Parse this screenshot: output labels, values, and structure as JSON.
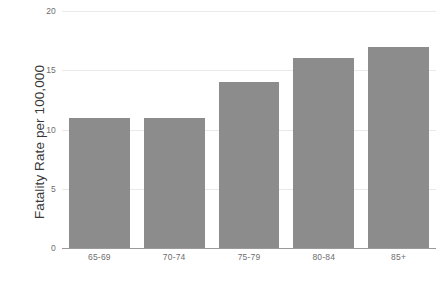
{
  "chart_data": {
    "type": "bar",
    "title": "",
    "subtitle": "",
    "xlabel": "",
    "ylabel": "Fatality Rate per 100,000",
    "categories": [
      "65-69",
      "70-74",
      "75-79",
      "80-84",
      "85+"
    ],
    "values": [
      11,
      11,
      14,
      16,
      17
    ],
    "series": [
      {
        "name": "Fatality Rate per 100,000",
        "values": [
          11,
          11,
          14,
          16,
          17
        ]
      }
    ],
    "ylim": [
      0,
      20
    ],
    "yticks": [
      0,
      5,
      10,
      15,
      20
    ],
    "ytick_labels": [
      "0",
      "5",
      "10",
      "15",
      "20"
    ],
    "xtick_labels": [
      "65-69",
      "70-74",
      "75-79",
      "80-84",
      "85+"
    ],
    "grid": true,
    "grid_axis": "y",
    "legend": false,
    "legend_position": "none",
    "annotations": [],
    "colors": {
      "bar": "#8c8c8c",
      "gridline": "#e9e9e9",
      "axis_line": "#9a9a9a",
      "tick_text": "#6e6e6e",
      "axis_title_text": "#3a3a3a",
      "background": "#ffffff"
    }
  }
}
